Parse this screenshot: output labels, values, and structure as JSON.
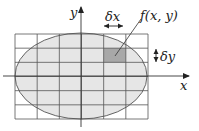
{
  "diagram": {
    "labels": {
      "y_axis": "y",
      "x_axis": "x",
      "delta_x": "δx",
      "delta_y": "δy",
      "function": "f(x, y)"
    },
    "grid": {
      "columns": 6,
      "rows": 6
    },
    "highlighted_cell": {
      "column": 5,
      "row": 2
    },
    "colors": {
      "grid_line": "#555555",
      "ellipse_fill": "#e6e6e6",
      "ellipse_stroke": "#555555",
      "cell_fill": "#a8a8a8",
      "axis": "#333333"
    }
  }
}
